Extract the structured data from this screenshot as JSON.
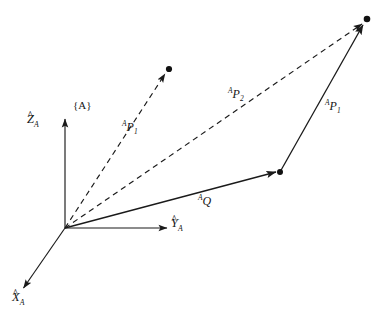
{
  "figure": {
    "background_color": "#ffffff",
    "stroke_color": "#1a1a1a",
    "width": 388,
    "height": 319
  },
  "frame": {
    "label": "{A}",
    "origin_label": ""
  },
  "axes": [
    {
      "name": "z-axis",
      "letter": "Z",
      "subscript": "A",
      "hat": "^",
      "from": [
        65,
        228
      ],
      "to": [
        65,
        118
      ],
      "label_pos": [
        28,
        116
      ]
    },
    {
      "name": "y-axis",
      "letter": "Y",
      "subscript": "A",
      "hat": "^",
      "from": [
        65,
        228
      ],
      "to": [
        168,
        228
      ],
      "label_pos": [
        171,
        218
      ]
    },
    {
      "name": "x-axis",
      "letter": "X",
      "subscript": "A",
      "hat": "^",
      "from": [
        65,
        228
      ],
      "to": [
        22,
        290
      ],
      "label_pos": [
        12,
        292
      ]
    }
  ],
  "vectors": [
    {
      "name": "vector-ap1-dashed",
      "letter": "P",
      "superscript": "A",
      "subscript": "1",
      "style": "dashed",
      "from": [
        65,
        228
      ],
      "to": [
        166,
        73
      ],
      "endpoint_dot": [
        169,
        69
      ],
      "label_pos": [
        122,
        118
      ]
    },
    {
      "name": "vector-ap2-dashed",
      "letter": "P",
      "superscript": "A",
      "subscript": "2",
      "style": "dashed",
      "from": [
        65,
        228
      ],
      "to": [
        363,
        23
      ],
      "endpoint_dot": [
        367,
        19
      ],
      "label_pos": [
        228,
        85
      ]
    },
    {
      "name": "vector-aq-solid",
      "letter": "Q",
      "superscript": "A",
      "subscript": "",
      "style": "solid",
      "from": [
        65,
        228
      ],
      "to": [
        277,
        172
      ],
      "endpoint_dot": [
        280,
        172
      ],
      "label_pos": [
        198,
        192
      ]
    },
    {
      "name": "vector-ap1-solid",
      "letter": "P",
      "superscript": "A",
      "subscript": "1",
      "style": "solid",
      "from": [
        280,
        172
      ],
      "to": [
        364,
        24
      ],
      "endpoint_dot": [
        367,
        19
      ],
      "label_pos": [
        325,
        98
      ]
    }
  ],
  "points": [
    {
      "name": "point-p1",
      "pos": [
        169,
        69
      ]
    },
    {
      "name": "point-p2",
      "pos": [
        367,
        19
      ]
    },
    {
      "name": "point-q",
      "pos": [
        280,
        172
      ]
    }
  ]
}
